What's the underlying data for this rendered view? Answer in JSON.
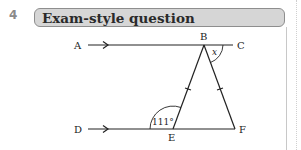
{
  "question": {
    "number": "4",
    "header_title": "Exam-style question"
  },
  "diagram": {
    "points": {
      "A": "A",
      "B": "B",
      "C": "C",
      "D": "D",
      "E": "E",
      "F": "F"
    },
    "angle_E": "111°",
    "angle_x": "x",
    "colors": {
      "line": "#222222",
      "header_bg": "#d6d6d6",
      "header_border": "#8e8e8e"
    }
  }
}
